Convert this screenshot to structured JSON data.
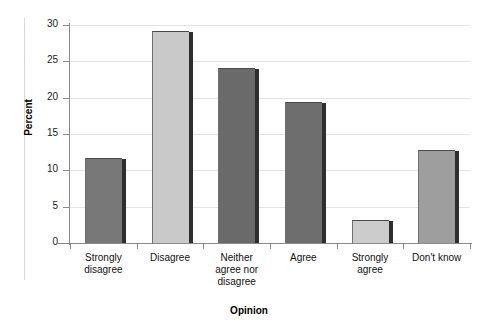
{
  "chart_data": {
    "type": "bar",
    "title": "",
    "xlabel": "Opinion",
    "ylabel": "Percent",
    "categories": [
      "Strongly\ndisagree",
      "Disagree",
      "Neither\nagree nor\ndisagree",
      "Agree",
      "Strongly\nagree",
      "Don't know"
    ],
    "values": [
      11.7,
      29.2,
      24.1,
      19.4,
      3.2,
      12.8
    ],
    "bar_colors": [
      "#787878",
      "#c9c9c9",
      "#6a6a6a",
      "#6e6e6e",
      "#cccccc",
      "#9e9e9e"
    ],
    "ylim": [
      0,
      30
    ],
    "yticks": [
      0,
      5,
      10,
      15,
      20,
      25,
      30
    ],
    "ytick_labels": [
      "0",
      "5",
      "10",
      "15",
      "20",
      "25",
      "30"
    ],
    "grid": true,
    "legend": false
  }
}
